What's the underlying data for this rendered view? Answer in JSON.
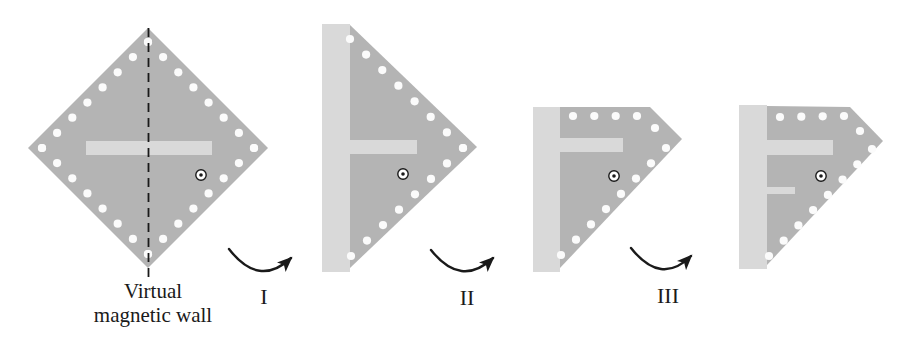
{
  "figure": {
    "caption": {
      "line1": "Virtual",
      "line2": "magnetic wall"
    },
    "steps": [
      {
        "label": "I"
      },
      {
        "label": "II"
      },
      {
        "label": "III"
      }
    ]
  },
  "colors": {
    "substrate": "#b4b4b4",
    "slot": "#d9d9d9",
    "via": "#fbfbfb",
    "ink": "#1a1a1a",
    "background": "#ffffff"
  }
}
